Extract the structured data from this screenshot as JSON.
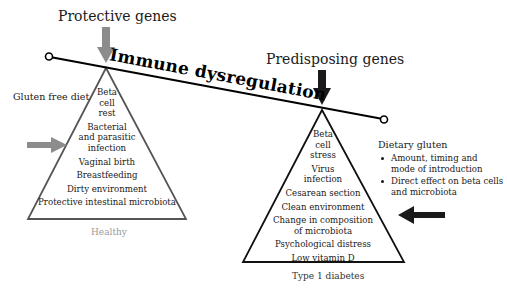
{
  "diagram": {
    "beam_label": "Immune dysregulation",
    "colors": {
      "protective": "#8c8c8c",
      "predisposing": "#1a1a1a",
      "healthy_caption": "#9a9a9a",
      "text": "#1a1a1a"
    },
    "left": {
      "heading": "Protective genes",
      "side_label": "Gluten free diet",
      "items": [
        [
          "Beta",
          "cell",
          "rest"
        ],
        [
          "Bacterial",
          "and parasitic",
          "infection"
        ],
        [
          "Vaginal birth"
        ],
        [
          "Breastfeeding"
        ],
        [
          "Dirty environment"
        ],
        [
          "Protective intestinal microbiota"
        ]
      ],
      "caption": "Healthy"
    },
    "right": {
      "heading": "Predisposing genes",
      "side_label": "Dietary gluten",
      "bullets": [
        [
          "Amount, timing and",
          "mode of introduction"
        ],
        [
          "Direct effect on beta cells",
          "and microbiota"
        ]
      ],
      "items": [
        [
          "Beta",
          "cell",
          "stress"
        ],
        [
          "Virus",
          "infection"
        ],
        [
          "Cesarean section"
        ],
        [
          "Clean environment"
        ],
        [
          "Change in composition",
          "of microbiota"
        ],
        [
          "Psychological distress"
        ],
        [
          "Low vitamin D"
        ]
      ],
      "caption": "Type 1 diabetes"
    },
    "icons": {
      "protective_genes_arrow": "arrow-down-gray",
      "gluten_free_arrow": "arrow-right-gray",
      "predisposing_genes_arrow": "arrow-down-black",
      "dietary_gluten_arrow": "arrow-left-black",
      "beam_end": "open-circle"
    }
  }
}
